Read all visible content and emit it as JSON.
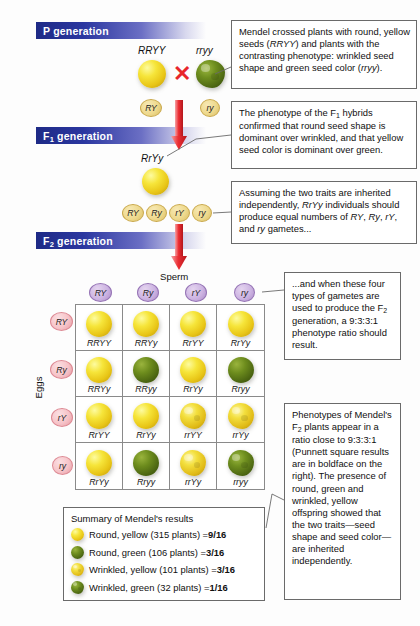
{
  "generations": [
    {
      "name": "p-generation",
      "label": "P",
      "suffix": " generation"
    },
    {
      "name": "f1-generation",
      "label": "F",
      "sub": "1",
      "suffix": " generation"
    },
    {
      "name": "f2-generation",
      "label": "F",
      "sub": "2",
      "suffix": " generation"
    }
  ],
  "parents": {
    "left_genotype": "RRYY",
    "right_genotype": "rryy",
    "cross_symbol": "✕",
    "left_gamete": "RY",
    "right_gamete": "ry"
  },
  "f1": {
    "genotype": "RrYy",
    "gametes": [
      "RY",
      "Ry",
      "rY",
      "ry"
    ]
  },
  "punnett": {
    "sperm_axis_label": "Sperm",
    "eggs_axis_label": "Eggs",
    "sperm_gametes": [
      "RY",
      "Ry",
      "rY",
      "ry"
    ],
    "egg_gametes": [
      "RY",
      "Ry",
      "rY",
      "ry"
    ],
    "cells": [
      {
        "genotype": "RRYY",
        "shape": "round",
        "color": "yellow"
      },
      {
        "genotype": "RRYy",
        "shape": "round",
        "color": "yellow"
      },
      {
        "genotype": "RrYY",
        "shape": "round",
        "color": "yellow"
      },
      {
        "genotype": "RrYy",
        "shape": "round",
        "color": "yellow"
      },
      {
        "genotype": "RRYy",
        "shape": "round",
        "color": "yellow"
      },
      {
        "genotype": "RRyy",
        "shape": "round",
        "color": "green"
      },
      {
        "genotype": "RrYy",
        "shape": "round",
        "color": "yellow"
      },
      {
        "genotype": "Rryy",
        "shape": "round",
        "color": "green"
      },
      {
        "genotype": "RrYY",
        "shape": "round",
        "color": "yellow"
      },
      {
        "genotype": "RrYy",
        "shape": "round",
        "color": "yellow"
      },
      {
        "genotype": "rrYY",
        "shape": "wrinkled",
        "color": "yellow"
      },
      {
        "genotype": "rrYy",
        "shape": "wrinkled",
        "color": "yellow"
      },
      {
        "genotype": "RrYy",
        "shape": "round",
        "color": "yellow"
      },
      {
        "genotype": "Rryy",
        "shape": "round",
        "color": "green"
      },
      {
        "genotype": "rrYy",
        "shape": "wrinkled",
        "color": "yellow"
      },
      {
        "genotype": "rryy",
        "shape": "wrinkled",
        "color": "green"
      }
    ]
  },
  "summary": {
    "title": "Summary of Mendel's results",
    "rows": [
      {
        "shape": "round",
        "color": "yellow",
        "text": "Round, yellow (315 plants) = ",
        "ratio": "9/16"
      },
      {
        "shape": "round",
        "color": "green",
        "text": "Round, green (106 plants) = ",
        "ratio": "3/16"
      },
      {
        "shape": "wrinkled",
        "color": "yellow",
        "text": "Wrinkled, yellow (101 plants) = ",
        "ratio": "3/16"
      },
      {
        "shape": "wrinkled",
        "color": "green",
        "text": "Wrinkled, green (32 plants) = ",
        "ratio": "1/16"
      }
    ]
  },
  "callouts": {
    "c1": "Mendel crossed plants with round, yellow seeds (RRYY) and plants with the contrasting phenotype: wrinkled seed shape and green seed color (rryy).",
    "c2": "The phenotype of the F1 hybrids confirmed that round seed shape is dominant over wrinkled, and that yellow seed color is dominant over green.",
    "c3": "Assuming the two traits are inherited independently, RrYy individuals should produce equal numbers of RY, Ry, rY, and ry gametes...",
    "c4": "...and when these four types of gametes are used to produce the F2 generation, a 9:3:3:1 phenotype ratio should result.",
    "c5": "Phenotypes of Mendel's F2 plants appear in a ratio close to 9:3:3:1 (Punnett square results are in boldface on the right). The presence of round, green and wrinkled, yellow offspring showed that the two traits—seed shape and seed color—are inherited independently."
  },
  "colors": {
    "bar_blue": "#1e2a86",
    "cross_red": "#e8262b",
    "seed_yellow": "#f6e53a",
    "seed_green": "#6d8c1d",
    "sperm_purple": "#cdb4e2",
    "egg_pink": "#f6c3c8"
  }
}
